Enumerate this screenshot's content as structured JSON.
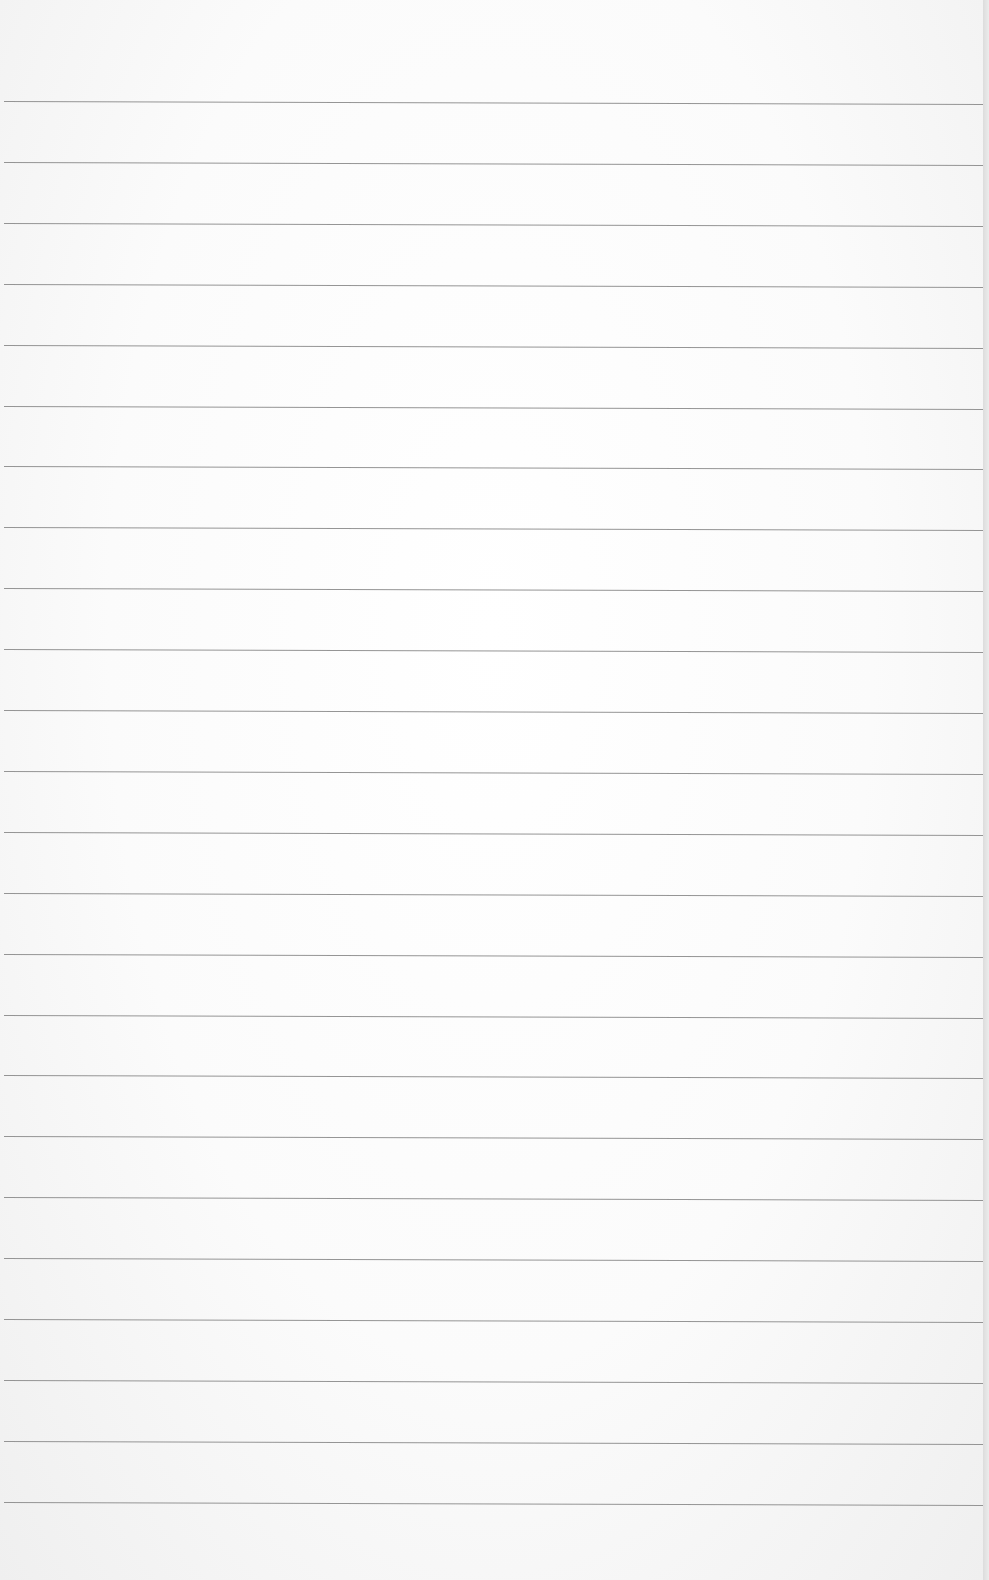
{
  "page": {
    "type": "lined-paper",
    "background_color": "#f7f7f7",
    "line_color": "#8a8a8a",
    "rules": {
      "count": 24,
      "first_y": 101,
      "spacing": 60.9
    }
  }
}
